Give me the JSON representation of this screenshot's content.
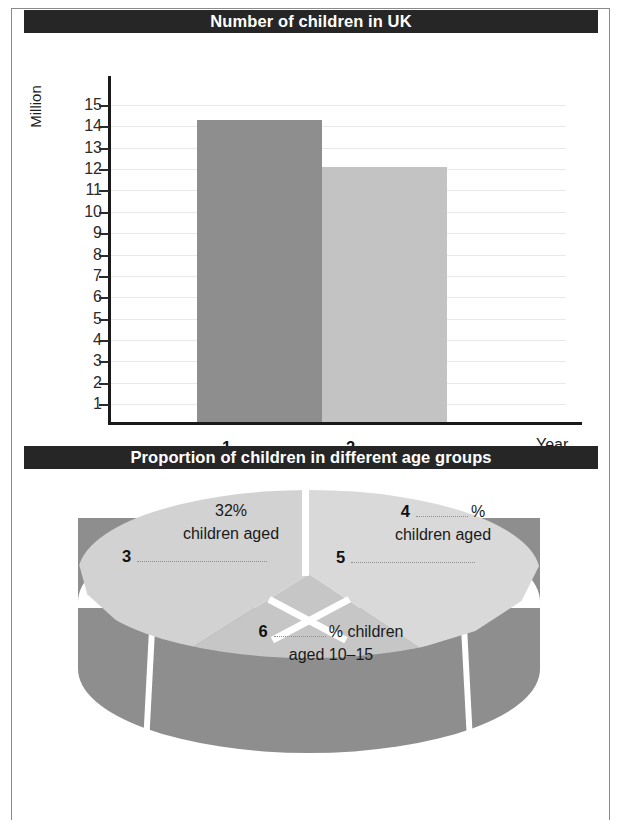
{
  "chart_data": [
    {
      "type": "bar",
      "title": "Number of children in UK",
      "categories": [
        "1",
        "2"
      ],
      "values": [
        14.3,
        12.1
      ],
      "ylabel": "Million",
      "xlabel": "Year",
      "ylim": [
        0,
        15
      ],
      "yticks": [
        15,
        14,
        13,
        12,
        11,
        10,
        9,
        8,
        7,
        6,
        5,
        4,
        3,
        2,
        1
      ],
      "grid": true,
      "legend": "none",
      "bar_colors": [
        "#8e8e8e",
        "#c3c3c3"
      ],
      "x_blanks": [
        {
          "number": "1",
          "answer": ""
        },
        {
          "number": "2",
          "answer": ""
        }
      ]
    },
    {
      "type": "pie",
      "title": "Proportion of children in different age groups",
      "style": "3d",
      "categories": [
        "children aged (3) ...",
        "children aged (5) ...",
        "children aged 10–15"
      ],
      "values": [
        32,
        34,
        34
      ],
      "labels": [
        {
          "percent": "32%",
          "line2": "children aged",
          "blank_number": "3"
        },
        {
          "percent_blank_number": "4",
          "percent_suffix": "%",
          "line2": "children aged",
          "blank_number": "5"
        },
        {
          "blank_number": "6",
          "line1_suffix": "% children",
          "line2": "aged 10–15"
        }
      ],
      "slice_colors": [
        "#d2d2d2",
        "#d9d9d9",
        "#c6c6c6"
      ],
      "side_color": "#8e8e8e"
    }
  ],
  "bar_chart": {
    "title": "Number of children in UK",
    "y_axis_title": "Million",
    "x_axis_title": "Year",
    "ticks": [
      "15",
      "14",
      "13",
      "12",
      "11",
      "10",
      "9",
      "8",
      "7",
      "6",
      "5",
      "4",
      "3",
      "2",
      "1"
    ],
    "x_labels": [
      {
        "number": "1"
      },
      {
        "number": "2"
      }
    ]
  },
  "pie_chart": {
    "title": "Proportion of children in different age groups",
    "left_slice": {
      "line1": "32%",
      "line2": "children aged",
      "blank_number": "3"
    },
    "right_slice": {
      "blank_number": "4",
      "percent_sign": "%",
      "line2": "children aged",
      "blank_number_2": "5"
    },
    "bottom_slice": {
      "blank_number": "6",
      "line1_suffix": "% children",
      "line2": "aged 10–15"
    }
  }
}
